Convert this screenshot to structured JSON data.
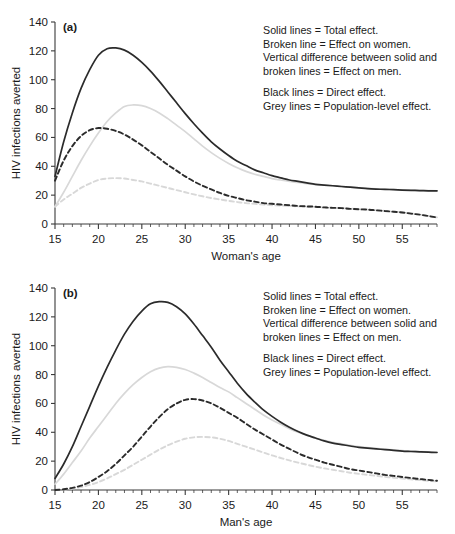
{
  "figure": {
    "background": "#ffffff"
  },
  "colors": {
    "black": "#2b2b2b",
    "grey": "#d8d8d8",
    "axis": "#3a3a3a",
    "text": "#1a1a1a"
  },
  "legend": {
    "group1": [
      "Solid lines = Total effect.",
      "Broken line = Effect on women.",
      "Vertical difference between solid and",
      "broken lines = Effect on men."
    ],
    "group2": [
      "Black lines = Direct effect.",
      "Grey lines = Population-level effect."
    ]
  },
  "panels": [
    {
      "tag": "(a)",
      "xlabel": "Woman's age",
      "ylabel": "HIV infections averted"
    },
    {
      "tag": "(b)",
      "xlabel": "Man's age",
      "ylabel": "HIV infections averted"
    }
  ],
  "chart_data": [
    {
      "type": "line",
      "title": "(a)",
      "xlabel": "Woman's age",
      "ylabel": "HIV infections averted",
      "xlim": [
        15,
        59
      ],
      "ylim": [
        0,
        140
      ],
      "xticks": [
        15,
        20,
        25,
        30,
        35,
        40,
        45,
        50,
        55
      ],
      "yticks": [
        0,
        20,
        40,
        60,
        80,
        100,
        120,
        140
      ],
      "xtick_minor_step": 1,
      "grid": false,
      "legend_position": "upper-right-inside",
      "x": [
        15,
        16,
        17,
        18,
        19,
        20,
        21,
        22,
        23,
        24,
        25,
        26,
        27,
        28,
        29,
        30,
        31,
        32,
        33,
        34,
        35,
        36,
        37,
        38,
        39,
        40,
        41,
        42,
        43,
        44,
        45,
        46,
        47,
        48,
        49,
        50,
        51,
        52,
        53,
        54,
        55,
        56,
        57,
        58,
        59
      ],
      "series": [
        {
          "name": "Black solid = Direct effect, total effect",
          "color": "#2b2b2b",
          "style": "solid",
          "values": [
            33,
            57,
            77,
            94,
            107,
            117,
            121.5,
            122,
            120.5,
            117,
            112,
            106,
            99,
            91.5,
            84,
            76.5,
            69.5,
            63,
            57,
            52,
            47.5,
            43.5,
            40.5,
            37.5,
            35.5,
            33.5,
            32,
            30.5,
            29.5,
            28.5,
            27.5,
            27,
            26.5,
            26,
            25.5,
            25,
            24.5,
            24.2,
            24,
            23.8,
            23.5,
            23.3,
            23.2,
            23,
            23
          ]
        },
        {
          "name": "Grey solid = Population-level effect, total effect",
          "color": "#d8d8d8",
          "style": "solid",
          "values": [
            12,
            22,
            33,
            44,
            54,
            63,
            71,
            77,
            81.5,
            82.5,
            82,
            80,
            77,
            73,
            68.5,
            64,
            59,
            54,
            49.5,
            45.5,
            42,
            39,
            36.5,
            34.5,
            33,
            31.5,
            30.5,
            29.5,
            28.8,
            28,
            27.5,
            27,
            26.5,
            26,
            25.5,
            25,
            24.7,
            24.4,
            24.1,
            23.9,
            23.6,
            23.4,
            23.2,
            23.1,
            23
          ]
        },
        {
          "name": "Black broken = Direct effect on women",
          "color": "#2b2b2b",
          "style": "dashed",
          "values": [
            30,
            44,
            54,
            61,
            65,
            66.5,
            66,
            64.5,
            62,
            58.5,
            54.5,
            50,
            45.5,
            41,
            37,
            33,
            29.5,
            26.5,
            24,
            21.5,
            19.5,
            18,
            16.5,
            15.5,
            14.5,
            14,
            13.5,
            13,
            12.5,
            12.2,
            12,
            11.5,
            11.2,
            11,
            10.5,
            10.2,
            10,
            9.5,
            9,
            8.5,
            8,
            7.2,
            6.5,
            5.5,
            4.5
          ]
        },
        {
          "name": "Grey broken = Population-level effect on women",
          "color": "#d8d8d8",
          "style": "dashed",
          "values": [
            12,
            17,
            21,
            25,
            28,
            30.5,
            31.5,
            31.8,
            31.5,
            30.5,
            29.5,
            28,
            26.5,
            25,
            23.5,
            22,
            20.5,
            19.2,
            18,
            17,
            16,
            15.2,
            14.5,
            14,
            13.5,
            13,
            12.8,
            12.5,
            12.2,
            12,
            11.8,
            11.5,
            11.2,
            11,
            10.6,
            10.3,
            10,
            9.6,
            9.1,
            8.6,
            8,
            7.3,
            6.5,
            5.6,
            4.6
          ]
        }
      ]
    },
    {
      "type": "line",
      "title": "(b)",
      "xlabel": "Man's age",
      "ylabel": "HIV infections averted",
      "xlim": [
        15,
        59
      ],
      "ylim": [
        0,
        140
      ],
      "xticks": [
        15,
        20,
        25,
        30,
        35,
        40,
        45,
        50,
        55
      ],
      "yticks": [
        0,
        20,
        40,
        60,
        80,
        100,
        120,
        140
      ],
      "xtick_minor_step": 1,
      "grid": false,
      "legend_position": "upper-right-inside",
      "x": [
        15,
        16,
        17,
        18,
        19,
        20,
        21,
        22,
        23,
        24,
        25,
        26,
        27,
        28,
        29,
        30,
        31,
        32,
        33,
        34,
        35,
        36,
        37,
        38,
        39,
        40,
        41,
        42,
        43,
        44,
        45,
        46,
        47,
        48,
        49,
        50,
        51,
        52,
        53,
        54,
        55,
        56,
        57,
        58,
        59
      ],
      "series": [
        {
          "name": "Black solid = Direct effect, total effect",
          "color": "#2b2b2b",
          "style": "solid",
          "values": [
            8,
            18,
            30,
            44,
            58,
            72,
            85,
            97,
            108,
            117,
            124,
            129,
            130.5,
            130,
            127,
            122,
            115,
            107,
            99,
            90,
            82,
            74,
            67,
            61,
            55.5,
            51,
            47,
            43.5,
            40.5,
            38,
            36,
            34,
            32.5,
            31.5,
            30.5,
            29.5,
            29,
            28.5,
            28,
            27.5,
            27,
            26.7,
            26.4,
            26.2,
            26
          ]
        },
        {
          "name": "Grey solid = Population-level effect, total effect",
          "color": "#d8d8d8",
          "style": "solid",
          "values": [
            4,
            11,
            19,
            27,
            36,
            44,
            52,
            60,
            67,
            73,
            78,
            82,
            84.5,
            85.5,
            85,
            83.5,
            81,
            78,
            74.5,
            71,
            68,
            64,
            60,
            56,
            52,
            48.5,
            45.5,
            42.5,
            40,
            38,
            36,
            34.5,
            33,
            32,
            31,
            30,
            29.3,
            28.8,
            28.3,
            27.8,
            27.3,
            27,
            26.7,
            26.4,
            26.2
          ]
        },
        {
          "name": "Black broken = Direct effect on women",
          "color": "#2b2b2b",
          "style": "dashed",
          "values": [
            0,
            0.5,
            1.5,
            3,
            5.5,
            9,
            13,
            18,
            24,
            30,
            37,
            44,
            50.5,
            56,
            60,
            62.5,
            63,
            62,
            60,
            57,
            53.5,
            50,
            46,
            42,
            38.5,
            35,
            31.5,
            28.5,
            25.5,
            23,
            21,
            19,
            17.5,
            16,
            14.5,
            13.5,
            12.5,
            11.5,
            10.5,
            9.8,
            9,
            8.3,
            7.6,
            7,
            6.4
          ]
        },
        {
          "name": "Grey broken = Population-level effect on women",
          "color": "#d8d8d8",
          "style": "dashed",
          "values": [
            0,
            0.3,
            1,
            2,
            3.5,
            5.5,
            8,
            11,
            14,
            17.5,
            21,
            24.5,
            28,
            31,
            33.5,
            35.5,
            36.5,
            36.8,
            36.5,
            35.5,
            34,
            32,
            30,
            28,
            26,
            24,
            22.2,
            20.5,
            19,
            17.5,
            16.2,
            15,
            14,
            13,
            12,
            11.2,
            10.5,
            9.8,
            9.1,
            8.5,
            8,
            7.4,
            6.9,
            6.4,
            6
          ]
        }
      ]
    }
  ]
}
